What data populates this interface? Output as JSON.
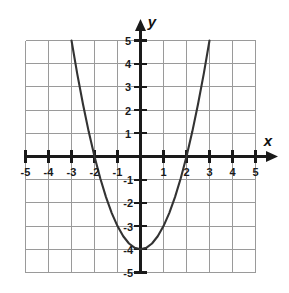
{
  "figure": {
    "kind": "coordinate-plane-graph",
    "background_color": "#ffffff",
    "grid_color": "#9a9a9a",
    "axis_color": "#1a1a1a",
    "curve_color": "#333333",
    "x_axis_label": "x",
    "y_axis_label": "y"
  },
  "axis_labels": {
    "x_negative": [
      "-5",
      "-4",
      "-3",
      "-2",
      "-1"
    ],
    "x_positive": [
      "1",
      "2",
      "3",
      "4",
      "5"
    ],
    "y_positive": [
      "5",
      "4",
      "3",
      "2",
      "1"
    ],
    "y_negative": [
      "-1",
      "-2",
      "-3",
      "-4",
      "-5"
    ]
  },
  "chart_data": {
    "type": "line",
    "title": "",
    "xlabel": "x",
    "ylabel": "y",
    "xlim": [
      -5,
      5
    ],
    "ylim": [
      -5,
      5
    ],
    "xticks": [
      -5,
      -4,
      -3,
      -2,
      -1,
      1,
      2,
      3,
      4,
      5
    ],
    "yticks": [
      -5,
      -4,
      -3,
      -2,
      -1,
      1,
      2,
      3,
      4,
      5
    ],
    "grid": true,
    "grid_step": 1,
    "legend": "none",
    "series": [
      {
        "name": "y = x^2 - 4",
        "equation": "y = x^2 - 4",
        "shape": "parabola",
        "vertex": [
          0,
          -4
        ],
        "x_intercepts": [
          -2,
          2
        ],
        "y_intercept": -4,
        "domain_drawn": [
          -3,
          3
        ],
        "x": [
          -3,
          -2.75,
          -2.5,
          -2.25,
          -2,
          -1.75,
          -1.5,
          -1.25,
          -1,
          -0.75,
          -0.5,
          -0.25,
          0,
          0.25,
          0.5,
          0.75,
          1,
          1.25,
          1.5,
          1.75,
          2,
          2.25,
          2.5,
          2.75,
          3
        ],
        "values": [
          5,
          3.5625,
          2.25,
          1.0625,
          0,
          -0.9375,
          -1.75,
          -2.4375,
          -3,
          -3.4375,
          -3.75,
          -3.9375,
          -4,
          -3.9375,
          -3.75,
          -3.4375,
          -3,
          -2.4375,
          -1.75,
          -0.9375,
          0,
          1.0625,
          2.25,
          3.5625,
          5
        ]
      }
    ]
  }
}
